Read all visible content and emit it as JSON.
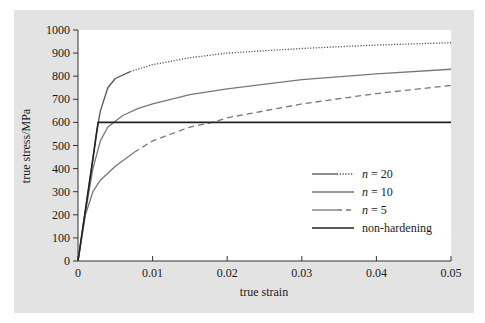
{
  "chart_data": {
    "type": "line",
    "title": "",
    "xlabel": "true strain",
    "ylabel": "true stress/MPa",
    "xlim": [
      0,
      0.05
    ],
    "ylim": [
      0,
      1000
    ],
    "xticks": [
      0,
      0.01,
      0.02,
      0.03,
      0.04,
      0.05
    ],
    "xtick_labels": [
      "0",
      "0.01",
      "0.02",
      "0.03",
      "0.04",
      "0.05"
    ],
    "yticks": [
      0,
      100,
      200,
      300,
      400,
      500,
      600,
      700,
      800,
      900,
      1000
    ],
    "ytick_labels": [
      "0",
      "100",
      "200",
      "300",
      "400",
      "500",
      "600",
      "700",
      "800",
      "900",
      "1000"
    ],
    "grid": false,
    "legend_position": "lower right",
    "series": [
      {
        "name": "n = 20",
        "style": "solid then dotted",
        "color": "#555555",
        "x": [
          0,
          0.001,
          0.002,
          0.0025,
          0.003,
          0.004,
          0.005,
          0.007,
          0.01,
          0.015,
          0.02,
          0.03,
          0.04,
          0.05
        ],
        "y": [
          0,
          220,
          440,
          560,
          650,
          750,
          790,
          820,
          850,
          880,
          900,
          920,
          935,
          945
        ]
      },
      {
        "name": "n = 10",
        "style": "solid",
        "color": "#777777",
        "x": [
          0,
          0.001,
          0.002,
          0.003,
          0.004,
          0.006,
          0.008,
          0.01,
          0.015,
          0.02,
          0.03,
          0.04,
          0.05
        ],
        "y": [
          0,
          210,
          400,
          520,
          580,
          630,
          660,
          680,
          720,
          745,
          785,
          810,
          830
        ]
      },
      {
        "name": "n = 5",
        "style": "solid then dashed",
        "color": "#777777",
        "x": [
          0,
          0.001,
          0.002,
          0.003,
          0.004,
          0.005,
          0.0075,
          0.01,
          0.015,
          0.018,
          0.02,
          0.03,
          0.04,
          0.05
        ],
        "y": [
          0,
          200,
          300,
          350,
          380,
          410,
          470,
          520,
          580,
          600,
          620,
          680,
          725,
          760
        ]
      },
      {
        "name": "non-hardening",
        "style": "solid",
        "color": "#222222",
        "x": [
          0,
          0.0027,
          0.05
        ],
        "y": [
          0,
          600,
          600
        ]
      }
    ]
  },
  "legend": {
    "items": [
      {
        "label_italic": "n",
        "label_rest": " = 20"
      },
      {
        "label_italic": "n",
        "label_rest": " = 10"
      },
      {
        "label_italic": "n",
        "label_rest": " = 5"
      },
      {
        "label_italic": "",
        "label_rest": "non-hardening"
      }
    ]
  }
}
